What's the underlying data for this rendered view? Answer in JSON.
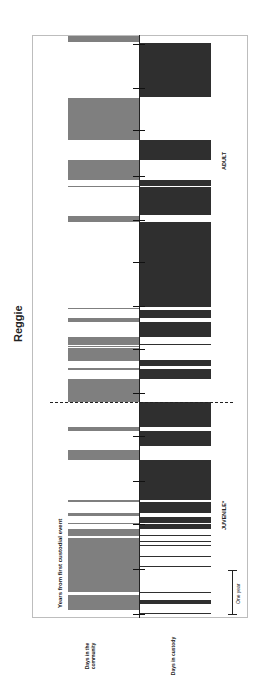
{
  "chart_data": {
    "type": "bar",
    "title": "Reggie",
    "orientation": "rotated-90deg timeline",
    "xlabel": "Years from first custodial event",
    "series": [
      {
        "name": "Days in the community",
        "color": "#7f7f7f"
      },
      {
        "name": "Days in custody",
        "color": "#2f2f2f"
      }
    ],
    "periods": [
      {
        "label": "JUVENILE*"
      },
      {
        "label": "ADULT"
      }
    ],
    "scale_annotation": "One year",
    "ticks_px": [
      44,
      88,
      130,
      176,
      220,
      262,
      306,
      349,
      393,
      436,
      481,
      524,
      569,
      614
    ],
    "juvenile_adult_boundary_px": 402,
    "community_bars_px": [
      [
        36,
        42
      ],
      [
        98,
        140
      ],
      [
        160,
        180
      ],
      [
        186,
        187
      ],
      [
        216,
        222
      ],
      [
        308,
        309
      ],
      [
        318,
        322
      ],
      [
        337,
        345
      ],
      [
        347,
        346
      ],
      [
        348,
        361
      ],
      [
        368,
        370
      ],
      [
        379,
        402
      ],
      [
        427,
        431
      ],
      [
        450,
        460
      ],
      [
        500,
        502
      ],
      [
        513,
        516
      ],
      [
        523,
        524
      ],
      [
        529,
        536
      ],
      [
        538,
        592
      ],
      [
        555,
        556
      ],
      [
        584,
        585
      ],
      [
        595,
        610
      ]
    ],
    "custody_bars_px": [
      [
        43,
        97
      ],
      [
        140,
        160
      ],
      [
        180,
        186
      ],
      [
        187,
        215
      ],
      [
        222,
        307
      ],
      [
        310,
        318
      ],
      [
        322,
        337
      ],
      [
        344,
        345
      ],
      [
        360,
        366
      ],
      [
        369,
        379
      ],
      [
        402,
        427
      ],
      [
        431,
        446
      ],
      [
        460,
        500
      ],
      [
        502,
        513
      ],
      [
        517,
        523
      ],
      [
        524,
        529
      ],
      [
        535,
        536
      ],
      [
        541,
        542
      ],
      [
        545,
        546
      ],
      [
        556,
        557
      ],
      [
        566,
        567
      ],
      [
        592,
        593
      ],
      [
        600,
        604
      ],
      [
        613,
        614
      ]
    ]
  },
  "labels": {
    "title": "Reggie",
    "x_axis": "Years from first custodial event",
    "juvenile": "JUVENILE*",
    "adult": "ADULT",
    "legend_community": "Days in the community",
    "legend_custody": "Days in custody",
    "one_year": "One year"
  }
}
